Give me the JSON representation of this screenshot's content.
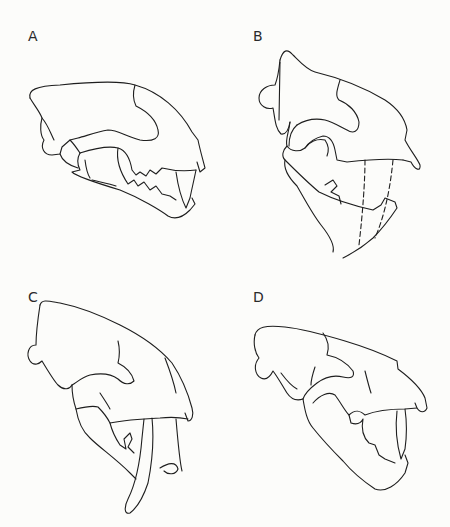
{
  "figure": {
    "background_color": "#fcfcfa",
    "line_color": "#1e1e1e",
    "panels": [
      {
        "label": "A",
        "subject": "felid skull, lateral view, jaws open, conical canines"
      },
      {
        "label": "B",
        "subject": "saber-toothed skull, lateral view, jaws wide open, dashed canine outline"
      },
      {
        "label": "C",
        "subject": "saber-toothed skull, lateral view, long saber canine"
      },
      {
        "label": "D",
        "subject": "felid skull, lateral view, jaws open, conical canines"
      }
    ]
  }
}
